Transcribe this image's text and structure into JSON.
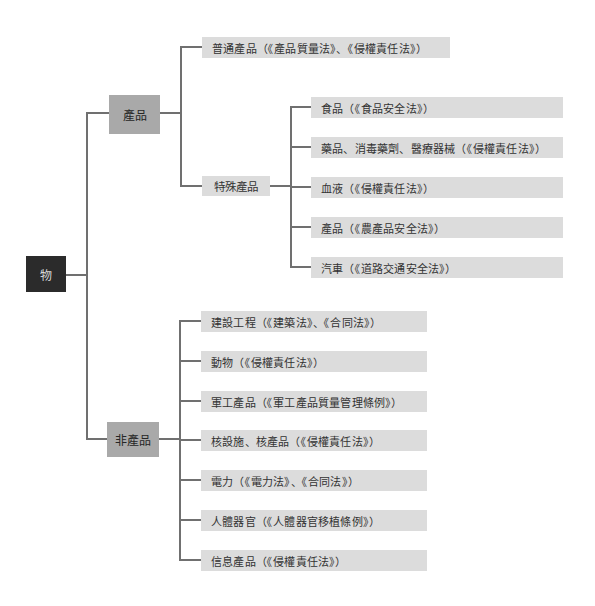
{
  "diagram": {
    "root": {
      "label": "物",
      "color": "#2b2b2b"
    },
    "branches": [
      {
        "label": "產品",
        "color": "#a9a9a9",
        "children": [
          {
            "label": "普通產品（《產品質量法》、《侵權責任法》）"
          },
          {
            "label": "特殊產品",
            "children": [
              {
                "label": "食品（《食品安全法》）"
              },
              {
                "label": "藥品、消毒藥劑、醫療器械（《侵權責任法》）"
              },
              {
                "label": "血液（《侵權責任法》）"
              },
              {
                "label": "產品（《農產品安全法》）"
              },
              {
                "label": "汽車（《道路交通安全法》）"
              }
            ]
          }
        ]
      },
      {
        "label": "非產品",
        "color": "#a9a9a9",
        "children": [
          {
            "label": "建設工程（《建築法》、《合同法》）"
          },
          {
            "label": "動物（《侵權責任法》）"
          },
          {
            "label": "軍工產品（《軍工產品質量管理條例》）"
          },
          {
            "label": "核設施、核產品（《侵權責任法》）"
          },
          {
            "label": "電力（《電力法》、《合同法》）"
          },
          {
            "label": "人體器官（《人體器官移植條例》）"
          },
          {
            "label": "信息產品（《侵權責任法》）"
          }
        ]
      }
    ],
    "colors": {
      "leaf": "#dcdcdc",
      "line": "#707070"
    }
  }
}
